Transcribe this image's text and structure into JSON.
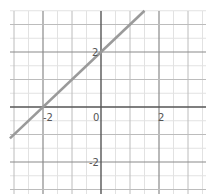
{
  "chart_data": {
    "type": "line",
    "title": "",
    "xlabel": "",
    "ylabel": "",
    "function": "y = x + 2",
    "series": [
      {
        "name": "y = x + 2",
        "x": [
          -3.14,
          1.5
        ],
        "y": [
          -1.14,
          3.5
        ],
        "color": "#9a9a9a"
      }
    ],
    "xlim": [
      -3.14,
      3.59
    ],
    "ylim": [
      -3.16,
      3.5
    ],
    "x_ticks": [
      {
        "value": -2,
        "label": "-2"
      },
      {
        "value": 0,
        "label": "0"
      },
      {
        "value": 2,
        "label": "2"
      }
    ],
    "y_ticks": [
      {
        "value": 2,
        "label": "2"
      },
      {
        "value": -2,
        "label": "-2"
      }
    ],
    "grid": {
      "on": true,
      "major_step": 1,
      "minor_step": 0.5
    },
    "legend": "none"
  },
  "colors": {
    "axis": "#555555",
    "major_grid": "#bcbcbc",
    "minor_grid": "#e2e2e2",
    "line": "#9a9a9a"
  }
}
